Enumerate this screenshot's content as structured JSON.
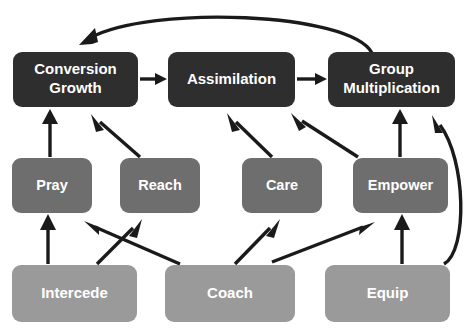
{
  "diagram": {
    "colors": {
      "tier_top_fill": "#2e2e2e",
      "tier_mid_fill": "#6e6e6e",
      "tier_bottom_fill": "#9a9a9a",
      "label_text": "#ffffff",
      "arrow": "#1a1a1a",
      "background": "#ffffff"
    },
    "tiers": [
      {
        "name": "outcomes",
        "fill": "#2e2e2e",
        "nodes": [
          {
            "id": "conversion-growth",
            "lines": [
              "Conversion",
              "Growth"
            ],
            "x": 13,
            "y": 52,
            "w": 125,
            "h": 55
          },
          {
            "id": "assimilation",
            "lines": [
              "Assimilation"
            ],
            "x": 168,
            "y": 52,
            "w": 127,
            "h": 55
          },
          {
            "id": "group-multiplication",
            "lines": [
              "Group",
              "Multiplication"
            ],
            "x": 328,
            "y": 52,
            "w": 127,
            "h": 55
          }
        ]
      },
      {
        "name": "ministries",
        "fill": "#6e6e6e",
        "nodes": [
          {
            "id": "pray",
            "lines": [
              "Pray"
            ],
            "x": 12,
            "y": 158,
            "w": 80,
            "h": 55
          },
          {
            "id": "reach",
            "lines": [
              "Reach"
            ],
            "x": 120,
            "y": 158,
            "w": 80,
            "h": 55
          },
          {
            "id": "care",
            "lines": [
              "Care"
            ],
            "x": 242,
            "y": 158,
            "w": 80,
            "h": 55
          },
          {
            "id": "empower",
            "lines": [
              "Empower"
            ],
            "x": 353,
            "y": 158,
            "w": 95,
            "h": 55
          }
        ]
      },
      {
        "name": "leaders",
        "fill": "#9a9a9a",
        "nodes": [
          {
            "id": "intercede",
            "lines": [
              "Intercede"
            ],
            "x": 12,
            "y": 265,
            "w": 125,
            "h": 57
          },
          {
            "id": "coach",
            "lines": [
              "Coach"
            ],
            "x": 165,
            "y": 265,
            "w": 130,
            "h": 57
          },
          {
            "id": "equip",
            "lines": [
              "Equip"
            ],
            "x": 325,
            "y": 265,
            "w": 125,
            "h": 57
          }
        ]
      }
    ],
    "edges": [
      {
        "id": "conversion-growth-to-assimilation",
        "from": "conversion-growth",
        "to": "assimilation"
      },
      {
        "id": "assimilation-to-group-multiplication",
        "from": "assimilation",
        "to": "group-multiplication"
      },
      {
        "id": "group-multiplication-to-conversion-growth",
        "from": "group-multiplication",
        "to": "conversion-growth"
      },
      {
        "id": "pray-to-conversion-growth",
        "from": "pray",
        "to": "conversion-growth"
      },
      {
        "id": "reach-to-conversion-growth",
        "from": "reach",
        "to": "conversion-growth"
      },
      {
        "id": "care-to-assimilation",
        "from": "care",
        "to": "assimilation"
      },
      {
        "id": "empower-to-assimilation",
        "from": "empower",
        "to": "assimilation"
      },
      {
        "id": "empower-to-group-multiplication",
        "from": "empower",
        "to": "group-multiplication"
      },
      {
        "id": "intercede-to-pray",
        "from": "intercede",
        "to": "pray"
      },
      {
        "id": "intercede-to-reach",
        "from": "intercede",
        "to": "reach"
      },
      {
        "id": "coach-to-pray",
        "from": "coach",
        "to": "pray"
      },
      {
        "id": "coach-to-care",
        "from": "coach",
        "to": "care"
      },
      {
        "id": "coach-to-empower",
        "from": "coach",
        "to": "empower"
      },
      {
        "id": "equip-to-empower",
        "from": "equip",
        "to": "empower"
      },
      {
        "id": "equip-to-group-multiplication",
        "from": "equip",
        "to": "group-multiplication"
      }
    ]
  }
}
